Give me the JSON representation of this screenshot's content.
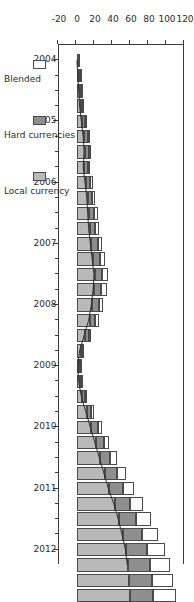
{
  "chart_data": {
    "type": "bar",
    "barmode": "stacked",
    "orientation": "vertical",
    "title": "",
    "subtitle": "",
    "xlabel": "",
    "ylabel": "",
    "xlim": [
      2003.75,
      2012.25
    ],
    "ylim": [
      -20,
      120
    ],
    "yticks": [
      120,
      100,
      80,
      60,
      40,
      20,
      0,
      -20
    ],
    "ytick_labels": [
      "120",
      "100",
      "80",
      "60",
      "40",
      "20",
      "0",
      "-20"
    ],
    "xticks": [
      2004,
      2005,
      2006,
      2007,
      2008,
      2009,
      2010,
      2011,
      2012
    ],
    "xtick_labels": [
      "2004",
      "2005",
      "2006",
      "2007",
      "2008",
      "2009",
      "2010",
      "2011",
      "2012"
    ],
    "minor_xticks_per_year": 4,
    "grid": false,
    "legend_position": "bottom-left",
    "legend": [
      "Blended",
      "Hard currencies",
      "Local currency"
    ],
    "x": [
      "2004Q1",
      "2004Q2",
      "2004Q3",
      "2004Q4",
      "2005Q1",
      "2005Q2",
      "2005Q3",
      "2005Q4",
      "2006Q1",
      "2006Q2",
      "2006Q3",
      "2006Q4",
      "2007Q1",
      "2007Q2",
      "2007Q3",
      "2007Q4",
      "2008Q1",
      "2008Q2",
      "2008Q3",
      "2008Q4",
      "2009Q1",
      "2009Q2",
      "2009Q3",
      "2009Q4",
      "2010Q1",
      "2010Q2",
      "2010Q3",
      "2010Q4",
      "2011Q1",
      "2011Q2",
      "2011Q3",
      "2011Q4",
      "2012Q1",
      "2012Q2",
      "2012Q3",
      "2012Q4"
    ],
    "series": [
      {
        "name": "Local currency",
        "color": "#b9b9b9",
        "values": [
          1,
          2,
          3,
          4,
          6,
          8,
          9,
          8,
          10,
          12,
          13,
          14,
          16,
          18,
          20,
          19,
          17,
          14,
          9,
          4,
          2,
          3,
          6,
          11,
          16,
          21,
          26,
          31,
          36,
          42,
          47,
          51,
          55,
          57,
          58,
          59
        ]
      },
      {
        "name": "Hard currencies",
        "color": "#8e8e8e",
        "values": [
          1,
          1,
          2,
          2,
          3,
          4,
          4,
          4,
          5,
          5,
          6,
          6,
          7,
          8,
          8,
          8,
          7,
          6,
          4,
          2,
          1,
          2,
          3,
          5,
          7,
          9,
          11,
          13,
          15,
          17,
          19,
          21,
          23,
          24,
          25,
          25
        ]
      },
      {
        "name": "Blended",
        "color": "#ffffff",
        "values": [
          0,
          1,
          1,
          1,
          2,
          2,
          3,
          2,
          3,
          3,
          4,
          4,
          5,
          5,
          6,
          6,
          5,
          4,
          3,
          1,
          1,
          1,
          2,
          3,
          5,
          6,
          8,
          10,
          12,
          14,
          16,
          18,
          20,
          22,
          24,
          26
        ]
      }
    ],
    "line_overlay": {
      "name": "hard-currencies-cumulative-boundary",
      "description": "boundary line between Local currency and Hard currencies segments",
      "values": [
        1,
        2,
        3,
        4,
        6,
        8,
        9,
        8,
        10,
        12,
        13,
        14,
        16,
        18,
        20,
        19,
        17,
        14,
        9,
        4,
        2,
        3,
        6,
        11,
        16,
        21,
        26,
        31,
        36,
        42,
        47,
        51,
        55,
        57,
        58,
        59
      ]
    }
  },
  "legend": {
    "items": [
      {
        "label": "Blended",
        "swatch": "blend",
        "color": "#ffffff"
      },
      {
        "label": "Hard currencies",
        "swatch": "hard",
        "color": "#8e8e8e"
      },
      {
        "label": "Local currency",
        "swatch": "local",
        "color": "#b9b9b9"
      }
    ]
  }
}
